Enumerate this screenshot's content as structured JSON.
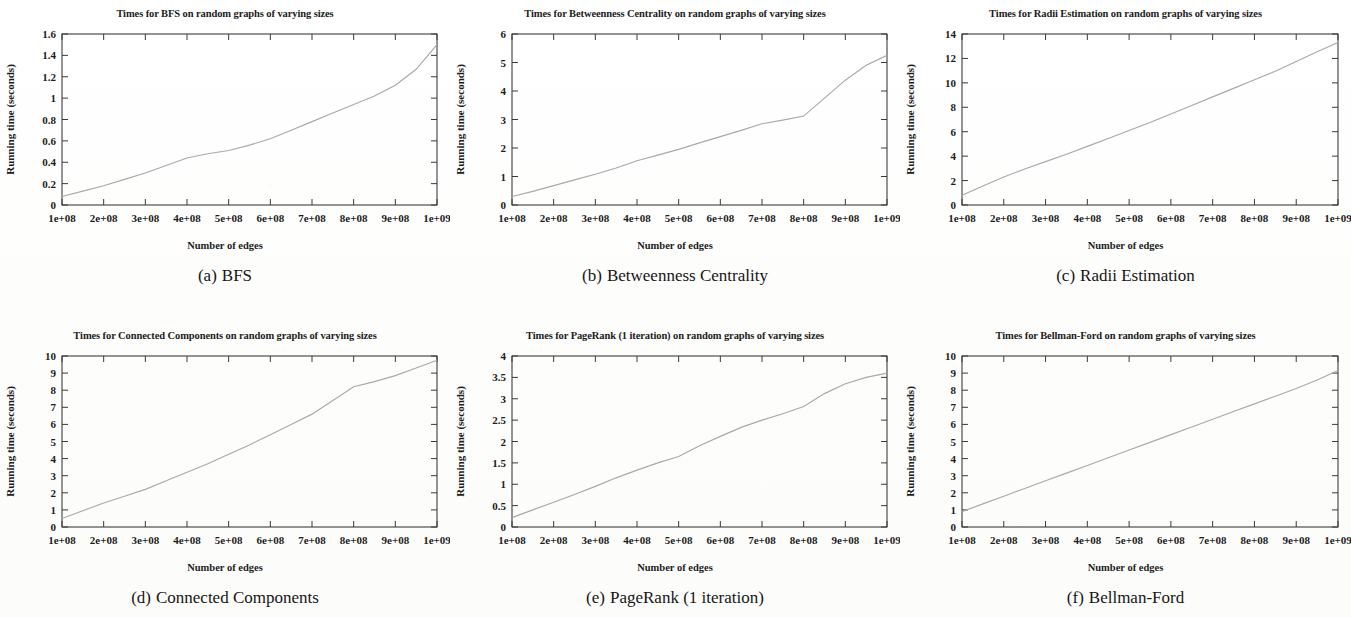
{
  "figure": {
    "axis_label_y": "Running time (seconds)",
    "axis_label_x": "Number of edges",
    "xtick_labels": [
      "1e+08",
      "2e+08",
      "3e+08",
      "4e+08",
      "5e+08",
      "6e+08",
      "7e+08",
      "8e+08",
      "9e+08",
      "1e+09"
    ],
    "curve_color": "#a9a9a9",
    "axis_color": "#2b2b2b"
  },
  "panels": [
    {
      "id": "bfs",
      "caption_letter": "(a)",
      "caption_text": "BFS",
      "chart_data": {
        "type": "line",
        "title": "Times for BFS on random graphs of varying sizes",
        "xlabel": "Number of edges",
        "ylabel": "Running time (seconds)",
        "xlim": [
          100000000,
          1000000000
        ],
        "ylim": [
          0,
          1.6
        ],
        "xticks": [
          100000000,
          200000000,
          300000000,
          400000000,
          500000000,
          600000000,
          700000000,
          800000000,
          900000000,
          1000000000
        ],
        "xtick_labels": [
          "1e+08",
          "2e+08",
          "3e+08",
          "4e+08",
          "5e+08",
          "6e+08",
          "7e+08",
          "8e+08",
          "9e+08",
          "1e+09"
        ],
        "yticks": [
          0,
          0.2,
          0.4,
          0.6,
          0.8,
          1,
          1.2,
          1.4,
          1.6
        ],
        "ytick_labels": [
          "0",
          "0.2",
          "0.4",
          "0.6",
          "0.8",
          "1",
          "1.2",
          "1.4",
          "1.6"
        ],
        "grid": false,
        "legend": "none",
        "series": [
          {
            "name": "BFS running time",
            "x": [
              100000000,
              150000000,
              200000000,
              250000000,
              300000000,
              350000000,
              400000000,
              450000000,
              500000000,
              550000000,
              600000000,
              650000000,
              700000000,
              750000000,
              800000000,
              850000000,
              900000000,
              950000000,
              1000000000
            ],
            "values": [
              0.08,
              0.13,
              0.18,
              0.24,
              0.3,
              0.37,
              0.44,
              0.48,
              0.51,
              0.56,
              0.62,
              0.7,
              0.78,
              0.86,
              0.94,
              1.02,
              1.12,
              1.27,
              1.5
            ]
          }
        ]
      }
    },
    {
      "id": "betweenness-centrality",
      "caption_letter": "(b)",
      "caption_text": "Betweenness Centrality",
      "chart_data": {
        "type": "line",
        "title": "Times for Betweenness Centrality on random graphs of varying sizes",
        "xlabel": "Number of edges",
        "ylabel": "Running time (seconds)",
        "xlim": [
          100000000,
          1000000000
        ],
        "ylim": [
          0,
          6
        ],
        "xticks": [
          100000000,
          200000000,
          300000000,
          400000000,
          500000000,
          600000000,
          700000000,
          800000000,
          900000000,
          1000000000
        ],
        "xtick_labels": [
          "1e+08",
          "2e+08",
          "3e+08",
          "4e+08",
          "5e+08",
          "6e+08",
          "7e+08",
          "8e+08",
          "9e+08",
          "1e+09"
        ],
        "yticks": [
          0,
          1,
          2,
          3,
          4,
          5,
          6
        ],
        "ytick_labels": [
          "0",
          "1",
          "2",
          "3",
          "4",
          "5",
          "6"
        ],
        "grid": false,
        "legend": "none",
        "series": [
          {
            "name": "Betweenness Centrality running time",
            "x": [
              100000000,
              150000000,
              200000000,
              250000000,
              300000000,
              350000000,
              400000000,
              450000000,
              500000000,
              550000000,
              600000000,
              650000000,
              700000000,
              750000000,
              800000000,
              850000000,
              900000000,
              950000000,
              1000000000
            ],
            "values": [
              0.3,
              0.48,
              0.68,
              0.88,
              1.08,
              1.3,
              1.55,
              1.75,
              1.95,
              2.18,
              2.4,
              2.62,
              2.85,
              2.98,
              3.12,
              3.75,
              4.38,
              4.9,
              5.25
            ]
          }
        ]
      }
    },
    {
      "id": "radii-estimation",
      "caption_letter": "(c)",
      "caption_text": "Radii Estimation",
      "chart_data": {
        "type": "line",
        "title": "Times for Radii Estimation on random graphs of varying sizes",
        "xlabel": "Number of edges",
        "ylabel": "Running time (seconds)",
        "xlim": [
          100000000,
          1000000000
        ],
        "ylim": [
          0,
          14
        ],
        "xticks": [
          100000000,
          200000000,
          300000000,
          400000000,
          500000000,
          600000000,
          700000000,
          800000000,
          900000000,
          1000000000
        ],
        "xtick_labels": [
          "1e+08",
          "2e+08",
          "3e+08",
          "4e+08",
          "5e+08",
          "6e+08",
          "7e+08",
          "8e+08",
          "9e+08",
          "1e+09"
        ],
        "yticks": [
          0,
          2,
          4,
          6,
          8,
          10,
          12,
          14
        ],
        "ytick_labels": [
          "0",
          "2",
          "4",
          "6",
          "8",
          "10",
          "12",
          "14"
        ],
        "grid": false,
        "legend": "none",
        "series": [
          {
            "name": "Radii Estimation running time",
            "x": [
              100000000,
              150000000,
              200000000,
              250000000,
              300000000,
              350000000,
              400000000,
              450000000,
              500000000,
              550000000,
              600000000,
              650000000,
              700000000,
              750000000,
              800000000,
              850000000,
              900000000,
              950000000,
              1000000000
            ],
            "values": [
              0.8,
              1.55,
              2.3,
              2.95,
              3.55,
              4.15,
              4.8,
              5.45,
              6.1,
              6.75,
              7.45,
              8.15,
              8.85,
              9.55,
              10.25,
              10.95,
              11.75,
              12.55,
              13.3
            ]
          }
        ]
      }
    },
    {
      "id": "connected-components",
      "caption_letter": "(d)",
      "caption_text": "Connected Components",
      "chart_data": {
        "type": "line",
        "title": "Times for Connected Components on random graphs of varying sizes",
        "xlabel": "Number of edges",
        "ylabel": "Running time (seconds)",
        "xlim": [
          100000000,
          1000000000
        ],
        "ylim": [
          0,
          10
        ],
        "xticks": [
          100000000,
          200000000,
          300000000,
          400000000,
          500000000,
          600000000,
          700000000,
          800000000,
          900000000,
          1000000000
        ],
        "xtick_labels": [
          "1e+08",
          "2e+08",
          "3e+08",
          "4e+08",
          "5e+08",
          "6e+08",
          "7e+08",
          "8e+08",
          "9e+08",
          "1e+09"
        ],
        "yticks": [
          0,
          1,
          2,
          3,
          4,
          5,
          6,
          7,
          8,
          9,
          10
        ],
        "ytick_labels": [
          "0",
          "1",
          "2",
          "3",
          "4",
          "5",
          "6",
          "7",
          "8",
          "9",
          "10"
        ],
        "grid": false,
        "legend": "none",
        "series": [
          {
            "name": "Connected Components running time",
            "x": [
              100000000,
              150000000,
              200000000,
              250000000,
              300000000,
              350000000,
              400000000,
              450000000,
              500000000,
              550000000,
              600000000,
              650000000,
              700000000,
              750000000,
              800000000,
              850000000,
              900000000,
              950000000,
              1000000000
            ],
            "values": [
              0.5,
              0.95,
              1.4,
              1.8,
              2.2,
              2.7,
              3.2,
              3.7,
              4.25,
              4.8,
              5.4,
              6.0,
              6.6,
              7.4,
              8.2,
              8.5,
              8.85,
              9.3,
              9.75
            ]
          }
        ]
      }
    },
    {
      "id": "pagerank",
      "caption_letter": "(e)",
      "caption_text": "PageRank (1 iteration)",
      "chart_data": {
        "type": "line",
        "title": "Times for PageRank (1 iteration) on random graphs of varying sizes",
        "xlabel": "Number of edges",
        "ylabel": "Running time (seconds)",
        "xlim": [
          100000000,
          1000000000
        ],
        "ylim": [
          0,
          4
        ],
        "xticks": [
          100000000,
          200000000,
          300000000,
          400000000,
          500000000,
          600000000,
          700000000,
          800000000,
          900000000,
          1000000000
        ],
        "xtick_labels": [
          "1e+08",
          "2e+08",
          "3e+08",
          "4e+08",
          "5e+08",
          "6e+08",
          "7e+08",
          "8e+08",
          "9e+08",
          "1e+09"
        ],
        "yticks": [
          0,
          0.5,
          1,
          1.5,
          2,
          2.5,
          3,
          3.5,
          4
        ],
        "ytick_labels": [
          "0",
          "0.5",
          "1",
          "1.5",
          "2",
          "2.5",
          "3",
          "3.5",
          "4"
        ],
        "grid": false,
        "legend": "none",
        "series": [
          {
            "name": "PageRank running time",
            "x": [
              100000000,
              150000000,
              200000000,
              250000000,
              300000000,
              350000000,
              400000000,
              450000000,
              500000000,
              550000000,
              600000000,
              650000000,
              700000000,
              750000000,
              800000000,
              850000000,
              900000000,
              950000000,
              1000000000
            ],
            "values": [
              0.22,
              0.4,
              0.58,
              0.76,
              0.95,
              1.15,
              1.33,
              1.5,
              1.65,
              1.9,
              2.12,
              2.33,
              2.5,
              2.65,
              2.82,
              3.12,
              3.35,
              3.5,
              3.6
            ]
          }
        ]
      }
    },
    {
      "id": "bellman-ford",
      "caption_letter": "(f)",
      "caption_text": "Bellman-Ford",
      "chart_data": {
        "type": "line",
        "title": "Times for Bellman-Ford on random graphs of varying sizes",
        "xlabel": "Number of edges",
        "ylabel": "Running time (seconds)",
        "xlim": [
          100000000,
          1000000000
        ],
        "ylim": [
          0,
          10
        ],
        "xticks": [
          100000000,
          200000000,
          300000000,
          400000000,
          500000000,
          600000000,
          700000000,
          800000000,
          900000000,
          1000000000
        ],
        "xtick_labels": [
          "1e+08",
          "2e+08",
          "3e+08",
          "4e+08",
          "5e+08",
          "6e+08",
          "7e+08",
          "8e+08",
          "9e+08",
          "1e+09"
        ],
        "yticks": [
          0,
          1,
          2,
          3,
          4,
          5,
          6,
          7,
          8,
          9,
          10
        ],
        "ytick_labels": [
          "0",
          "1",
          "2",
          "3",
          "4",
          "5",
          "6",
          "7",
          "8",
          "9",
          "10"
        ],
        "grid": false,
        "legend": "none",
        "series": [
          {
            "name": "Bellman-Ford running time",
            "x": [
              100000000,
              150000000,
              200000000,
              250000000,
              300000000,
              350000000,
              400000000,
              450000000,
              500000000,
              550000000,
              600000000,
              650000000,
              700000000,
              750000000,
              800000000,
              850000000,
              900000000,
              950000000,
              1000000000
            ],
            "values": [
              0.9,
              1.35,
              1.8,
              2.25,
              2.7,
              3.15,
              3.6,
              4.05,
              4.5,
              4.95,
              5.4,
              5.85,
              6.3,
              6.75,
              7.2,
              7.65,
              8.1,
              8.6,
              9.15
            ]
          }
        ]
      }
    }
  ]
}
